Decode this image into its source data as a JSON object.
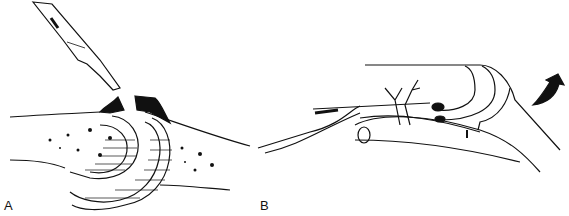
{
  "figure": {
    "panels": [
      {
        "label": "A",
        "description": "Scalpel incising joint capsule over dorsal osteophytes of a joint"
      },
      {
        "label": "B",
        "description": "Joint capsule retraction with vessel branching over tendon; curved arrow indicates motion"
      }
    ],
    "colors": {
      "ink": "#111111",
      "background": "#ffffff"
    }
  }
}
